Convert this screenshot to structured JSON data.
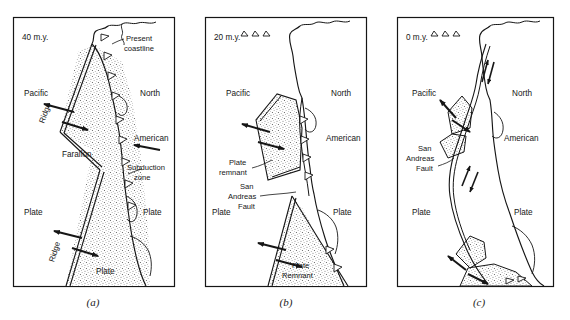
{
  "figure": {
    "type": "geologic-diagram",
    "background_color": "#ffffff",
    "line_color": "#161616",
    "stipple_color": "#3a3a3a",
    "panel_count": 3
  },
  "panels": [
    {
      "id": "a",
      "caption": "(a)",
      "age_label": "40 m.y.",
      "labels": {
        "pacific": "Pacific",
        "plate_left": "Plate",
        "north": "North",
        "american": "American",
        "plate_right": "Plate",
        "farallon": "Farallon",
        "plate_farallon": "Plate",
        "ridge_upper": "Ridge",
        "ridge_lower": "Ridge",
        "present_coastline": "Present\ncoastline",
        "present_coastline_line1": "Present",
        "present_coastline_line2": "coastline",
        "subduction_zone_line1": "Subduction",
        "subduction_zone_line2": "zone"
      }
    },
    {
      "id": "b",
      "caption": "(b)",
      "age_label": "20 m.y.",
      "labels": {
        "pacific": "Pacific",
        "plate_left": "Plate",
        "north": "North",
        "american": "American",
        "plate_right": "Plate",
        "plate_remnant_line1": "Plate",
        "plate_remnant_line2": "remnant",
        "san_andreas_line1": "San",
        "san_andreas_line2": "Andreas",
        "san_andreas_line3": "Fault",
        "plate_remnant_low_line1": "Plate",
        "plate_remnant_low_line2": "Remnant"
      }
    },
    {
      "id": "c",
      "caption": "(c)",
      "age_label": "0 m.y.",
      "labels": {
        "pacific": "Pacific",
        "plate_left": "Plate",
        "north": "North",
        "american": "American",
        "plate_right": "Plate",
        "san_andreas_line1": "San",
        "san_andreas_line2": "Andreas",
        "san_andreas_line3": "Fault"
      }
    }
  ]
}
